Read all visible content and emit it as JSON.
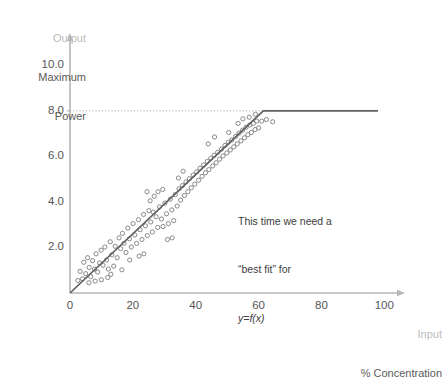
{
  "chart_data": {
    "type": "scatter",
    "title": "",
    "xlabel": "% Concentration",
    "ylabel": "Maximum Power",
    "xlabel_prefix": "Input",
    "ylabel_prefix": "Output",
    "xlim": [
      0,
      105
    ],
    "ylim": [
      0,
      11.2
    ],
    "grid": false,
    "legend": "none",
    "xticks": [
      "0",
      "20",
      "40",
      "60",
      "80",
      "100"
    ],
    "xtick_values": [
      0,
      20,
      40,
      60,
      80,
      100
    ],
    "yticks": [
      "2.0",
      "4.0",
      "6.0",
      "8.0",
      "10.0"
    ],
    "ytick_values": [
      2,
      4,
      6,
      8,
      10
    ],
    "origin_label": "0",
    "fit_line": {
      "label": "best fit piecewise line",
      "breakpoint_x": 61.5,
      "saturation_y": 8.0,
      "slope": 0.13,
      "end_x": 98,
      "color": "#5f5f5f"
    },
    "reference_line": {
      "label": "saturation reference",
      "y": 8.0,
      "x_from": 0,
      "x_to": 61.5,
      "style": "dotted",
      "color": "#9a9a9a"
    },
    "marker": {
      "shape": "open-circle",
      "size": 4.2,
      "color": "#7d7d7d"
    },
    "points": [
      [
        2.5,
        0.55
      ],
      [
        3.2,
        0.95
      ],
      [
        4.0,
        0.62
      ],
      [
        4.4,
        1.35
      ],
      [
        5.0,
        0.85
      ],
      [
        5.6,
        1.55
      ],
      [
        6.1,
        1.12
      ],
      [
        6.6,
        0.72
      ],
      [
        7.2,
        1.42
      ],
      [
        7.8,
        1.05
      ],
      [
        8.3,
        1.72
      ],
      [
        8.8,
        0.92
      ],
      [
        9.4,
        1.32
      ],
      [
        9.9,
        1.88
      ],
      [
        10.5,
        1.22
      ],
      [
        11.1,
        2.02
      ],
      [
        11.6,
        1.45
      ],
      [
        12.2,
        1.05
      ],
      [
        12.8,
        2.25
      ],
      [
        13.3,
        1.68
      ],
      [
        13.9,
        1.18
      ],
      [
        14.4,
        2.05
      ],
      [
        15.0,
        1.55
      ],
      [
        15.6,
        2.42
      ],
      [
        16.1,
        1.95
      ],
      [
        16.7,
        2.62
      ],
      [
        17.2,
        2.18
      ],
      [
        17.8,
        1.78
      ],
      [
        18.4,
        2.85
      ],
      [
        18.9,
        2.38
      ],
      [
        19.5,
        2.02
      ],
      [
        20.1,
        3.05
      ],
      [
        20.6,
        2.55
      ],
      [
        21.2,
        2.18
      ],
      [
        21.8,
        3.22
      ],
      [
        22.3,
        2.78
      ],
      [
        22.9,
        2.35
      ],
      [
        23.4,
        3.45
      ],
      [
        24.0,
        2.95
      ],
      [
        24.6,
        2.52
      ],
      [
        25.1,
        3.62
      ],
      [
        25.7,
        3.12
      ],
      [
        26.2,
        2.68
      ],
      [
        26.8,
        4.25
      ],
      [
        27.4,
        3.35
      ],
      [
        27.9,
        2.88
      ],
      [
        28.5,
        3.78
      ],
      [
        29.1,
        3.25
      ],
      [
        29.6,
        2.92
      ],
      [
        30.2,
        3.95
      ],
      [
        30.7,
        3.48
      ],
      [
        31.3,
        3.05
      ],
      [
        31.9,
        4.12
      ],
      [
        32.4,
        3.65
      ],
      [
        33.0,
        3.18
      ],
      [
        33.5,
        4.32
      ],
      [
        34.1,
        3.82
      ],
      [
        34.7,
        4.58
      ],
      [
        35.2,
        4.08
      ],
      [
        35.8,
        4.72
      ],
      [
        36.4,
        4.28
      ],
      [
        36.9,
        4.88
      ],
      [
        37.5,
        4.45
      ],
      [
        38.0,
        5.02
      ],
      [
        38.6,
        4.62
      ],
      [
        39.2,
        5.18
      ],
      [
        39.7,
        4.78
      ],
      [
        40.3,
        5.32
      ],
      [
        40.9,
        4.95
      ],
      [
        41.4,
        5.48
      ],
      [
        42.0,
        5.12
      ],
      [
        42.5,
        5.62
      ],
      [
        43.1,
        5.28
      ],
      [
        43.7,
        5.78
      ],
      [
        44.2,
        5.42
      ],
      [
        44.8,
        5.92
      ],
      [
        45.4,
        5.58
      ],
      [
        45.9,
        6.05
      ],
      [
        46.5,
        5.72
      ],
      [
        47.0,
        6.18
      ],
      [
        47.6,
        5.88
      ],
      [
        48.2,
        6.32
      ],
      [
        48.7,
        6.02
      ],
      [
        49.3,
        6.48
      ],
      [
        49.9,
        6.15
      ],
      [
        50.4,
        6.62
      ],
      [
        51.0,
        6.28
      ],
      [
        51.5,
        6.72
      ],
      [
        52.1,
        6.42
      ],
      [
        52.7,
        6.88
      ],
      [
        53.2,
        6.55
      ],
      [
        53.8,
        7.02
      ],
      [
        54.4,
        6.68
      ],
      [
        54.9,
        7.15
      ],
      [
        55.5,
        6.82
      ],
      [
        56.0,
        7.28
      ],
      [
        56.6,
        6.95
      ],
      [
        57.2,
        7.38
      ],
      [
        57.7,
        7.05
      ],
      [
        58.3,
        7.45
      ],
      [
        58.9,
        7.18
      ],
      [
        59.4,
        7.55
      ],
      [
        60.0,
        7.25
      ],
      [
        24.5,
        4.45
      ],
      [
        25.5,
        4.05
      ],
      [
        26.5,
        3.55
      ],
      [
        28.0,
        4.45
      ],
      [
        29.5,
        4.55
      ],
      [
        31.0,
        2.35
      ],
      [
        32.5,
        2.42
      ],
      [
        34.5,
        5.05
      ],
      [
        36.0,
        5.35
      ],
      [
        44.0,
        6.55
      ],
      [
        46.0,
        6.85
      ],
      [
        50.5,
        7.05
      ],
      [
        53.5,
        7.45
      ],
      [
        55.0,
        7.65
      ],
      [
        57.0,
        7.72
      ],
      [
        59.0,
        7.85
      ],
      [
        61.0,
        7.55
      ],
      [
        62.5,
        7.62
      ],
      [
        64.5,
        7.52
      ],
      [
        13.0,
        0.82
      ],
      [
        16.5,
        1.02
      ],
      [
        19.0,
        1.45
      ],
      [
        22.0,
        1.62
      ],
      [
        23.5,
        1.72
      ],
      [
        10.0,
        0.58
      ],
      [
        12.0,
        0.68
      ],
      [
        6.0,
        0.45
      ],
      [
        8.0,
        0.52
      ]
    ]
  },
  "annotation": {
    "line1": "This time we need a",
    "line2": "“best fit” for",
    "line3": "y=f(x)"
  },
  "axis_captions": {
    "y_soft": "Output",
    "y_main_line1": "Maximum",
    "y_main_line2": "Power",
    "x_soft": "Input",
    "x_main": "% Concentration"
  }
}
